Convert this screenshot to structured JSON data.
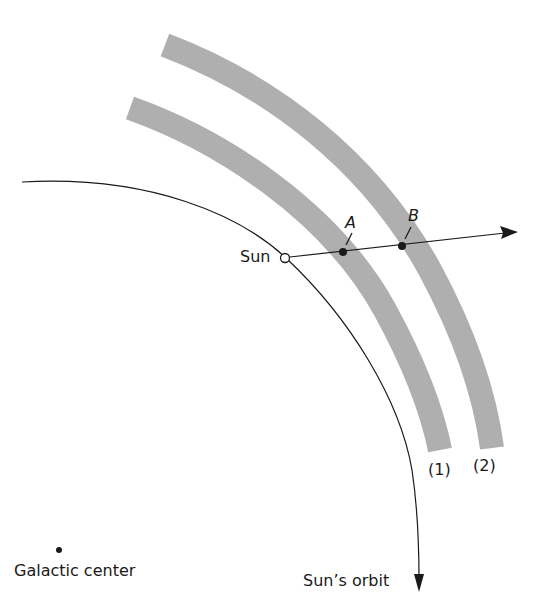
{
  "diagram": {
    "labels": {
      "sun": "Sun",
      "point_a": "A",
      "point_b": "B",
      "band_1": "(1)",
      "band_2": "(2)",
      "galactic_center": "Galactic center",
      "sun_orbit": "Sun’s orbit"
    },
    "colors": {
      "band": "#a9a9a9",
      "line": "#1a1a1a",
      "background": "#ffffff"
    }
  }
}
